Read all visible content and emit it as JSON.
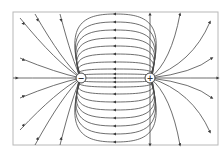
{
  "diagram": {
    "type": "electric-dipole-field-lines",
    "frame": {
      "x": 13,
      "y": 12,
      "width": 205,
      "height": 133,
      "stroke": "#b0b0b0"
    },
    "line_color": "#4a4a4a",
    "charges": [
      {
        "id": "negative",
        "symbol": "−",
        "x": 81,
        "y": 78,
        "r": 5
      },
      {
        "id": "positive",
        "symbol": "+",
        "x": 150,
        "y": 78,
        "r": 5
      }
    ],
    "field_direction": "from positive to negative"
  }
}
